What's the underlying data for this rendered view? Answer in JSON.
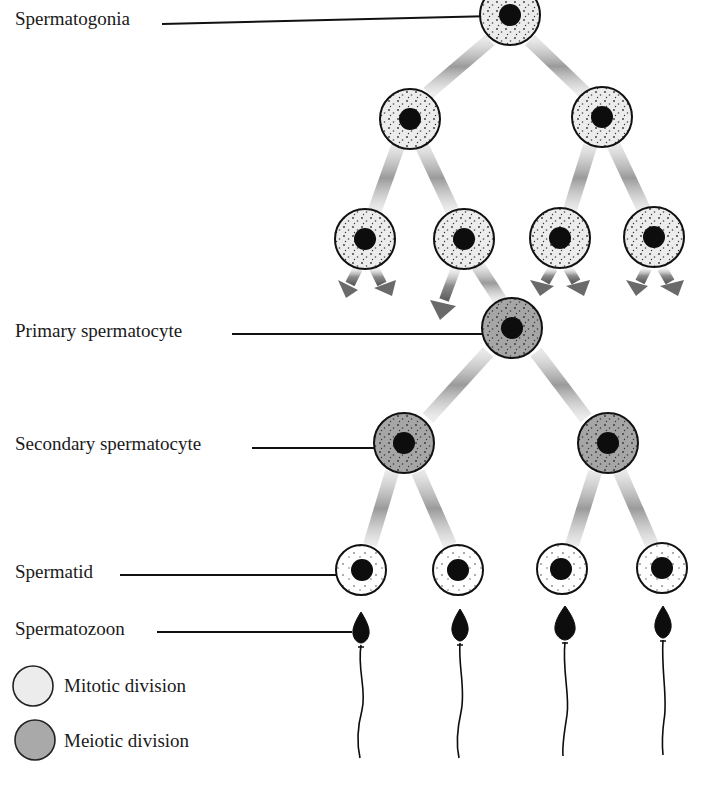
{
  "title_partial": "Spermatogenesis",
  "labels": {
    "spermatogonia": "Spermatogonia",
    "primary_spermatocyte": "Primary spermatocyte",
    "secondary_spermatocyte": "Secondary spermatocyte",
    "spermatid": "Spermatid",
    "spermatozoon": "Spermatozoon"
  },
  "legend": {
    "items": [
      {
        "label": "Mitotic division",
        "fill": "#ececec"
      },
      {
        "label": "Meiotic division",
        "fill": "#a9a9a9"
      }
    ]
  },
  "colors": {
    "mitotic_cell": "#ececec",
    "meiotic_cell": "#a4a4a4",
    "nucleus": "#0d0d0d",
    "outline": "#111111",
    "arrow_gray": "#8a8a8a"
  },
  "stages": [
    {
      "name": "Spermatogonia",
      "type": "mitotic",
      "count": 1
    },
    {
      "name": "Spermatogonia (2nd gen)",
      "type": "mitotic",
      "count": 2
    },
    {
      "name": "Spermatogonia (3rd gen)",
      "type": "mitotic",
      "count": 4
    },
    {
      "name": "Primary spermatocyte",
      "type": "meiotic",
      "count": 1
    },
    {
      "name": "Secondary spermatocyte",
      "type": "meiotic",
      "count": 2
    },
    {
      "name": "Spermatid",
      "type": "meiotic",
      "count": 4
    },
    {
      "name": "Spermatozoon",
      "type": "sperm",
      "count": 4
    }
  ]
}
